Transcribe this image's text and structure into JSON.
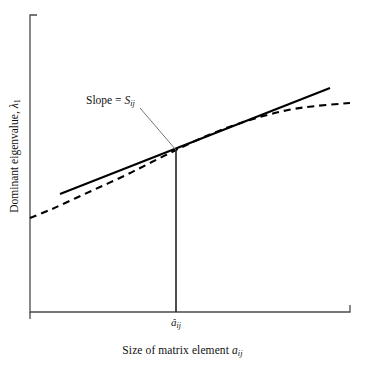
{
  "figure": {
    "background_color": "#ffffff",
    "line_color": "#000000"
  },
  "axes": {
    "y_axis_label_prefix": "Dominant eigenvalue, ",
    "y_axis_label_symbol": "λ",
    "y_axis_label_subscript": "1",
    "x_axis_label_prefix": "Size of matrix element ",
    "x_axis_label_symbol": "a",
    "x_axis_label_subscript": "ij",
    "x_tick_symbol": "â",
    "x_tick_subscript": "ij"
  },
  "annotation": {
    "text_prefix": "Slope = ",
    "symbol": "S",
    "subscript": "ij"
  },
  "chart_data": {
    "type": "line",
    "title": "",
    "xlabel": "Size of matrix element a_ij",
    "ylabel": "Dominant eigenvalue, lambda_1",
    "grid": false,
    "legend": "none",
    "axis_ticks": "none",
    "annotations": [
      {
        "label": "Slope = S_ij",
        "points_to": "tangent point of straight line and curve",
        "label_position_px": [
          88,
          103
        ],
        "leader_line_px": [
          [
            140,
            108
          ],
          [
            176,
            150
          ]
        ]
      },
      {
        "label": "a_hat_ij",
        "type": "x-axis tick label",
        "position_px": [
          176,
          322
        ]
      }
    ],
    "series": [
      {
        "name": "dominant eigenvalue curve",
        "style": "dashed",
        "color": "#000000",
        "description": "concave-down saturating curve of dominant eigenvalue versus matrix element size",
        "points_px": [
          [
            30,
            218
          ],
          [
            52,
            209
          ],
          [
            76,
            198
          ],
          [
            100,
            187
          ],
          [
            124,
            176
          ],
          [
            148,
            164
          ],
          [
            176,
            150
          ],
          [
            204,
            137
          ],
          [
            232,
            126
          ],
          [
            260,
            117
          ],
          [
            288,
            110
          ],
          [
            316,
            106
          ],
          [
            350,
            103
          ]
        ]
      },
      {
        "name": "tangent line at a_hat_ij",
        "style": "solid",
        "color": "#000000",
        "description": "straight line tangent to the curve at a_hat_ij, its gradient is the sensitivity S_ij",
        "points_px": [
          [
            60,
            194
          ],
          [
            330,
            88
          ]
        ]
      },
      {
        "name": "drop line at a_hat_ij",
        "style": "solid",
        "color": "#000000",
        "description": "vertical line from tangency point down to the horizontal axis",
        "points_px": [
          [
            176,
            150
          ],
          [
            176,
            312
          ]
        ]
      }
    ],
    "axis_geometry_px": {
      "x_axis": [
        [
          30,
          312
        ],
        [
          350,
          312
        ]
      ],
      "y_axis": [
        [
          30,
          15
        ],
        [
          30,
          312
        ]
      ],
      "y_axis_top_cap": [
        [
          30,
          15
        ],
        [
          37,
          15
        ]
      ],
      "x_axis_end_cap": [
        [
          350,
          312
        ],
        [
          350,
          305
        ]
      ],
      "origin_cap": [
        [
          30,
          312
        ],
        [
          30,
          319
        ]
      ]
    }
  }
}
